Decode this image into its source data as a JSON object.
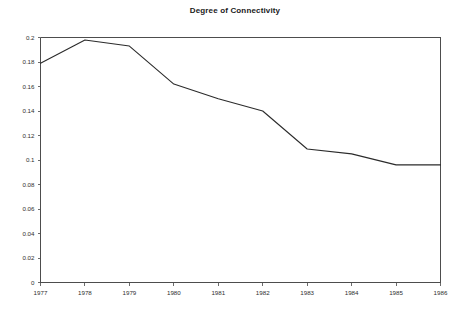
{
  "chart_data": {
    "type": "line",
    "title": "Degree of Connectivity",
    "xlabel": "",
    "ylabel": "",
    "categories": [
      "1977",
      "1978",
      "1979",
      "1980",
      "1981",
      "1982",
      "1983",
      "1984",
      "1985",
      "1986"
    ],
    "x": [
      1977,
      1978,
      1979,
      1980,
      1981,
      1982,
      1983,
      1984,
      1985,
      1986
    ],
    "values": [
      0.179,
      0.198,
      0.193,
      0.162,
      0.15,
      0.14,
      0.109,
      0.105,
      0.096,
      0.096
    ],
    "series": [
      {
        "name": "Degree of Connectivity",
        "values": [
          0.179,
          0.198,
          0.193,
          0.162,
          0.15,
          0.14,
          0.109,
          0.105,
          0.096,
          0.096
        ]
      }
    ],
    "xlim": [
      1977,
      1986
    ],
    "ylim": [
      0,
      0.2
    ],
    "ytick_values": [
      0,
      0.02,
      0.04,
      0.06,
      0.08,
      0.1,
      0.12,
      0.14,
      0.16,
      0.18,
      0.2
    ],
    "ytick_labels": [
      "0",
      "0.02",
      "0.04",
      "0.06",
      "0.08",
      "0.1",
      "0.12",
      "0.14",
      "0.16",
      "0.18",
      "0.2"
    ],
    "xtick_labels": [
      "1977",
      "1978",
      "1979",
      "1980",
      "1981",
      "1982",
      "1983",
      "1984",
      "1985",
      "1986"
    ],
    "grid": false,
    "legend": false,
    "legend_position": "none",
    "line_color": "#2b2b2b",
    "axis_color": "#4d4d4d",
    "background_color": "#ffffff",
    "markers": false
  }
}
